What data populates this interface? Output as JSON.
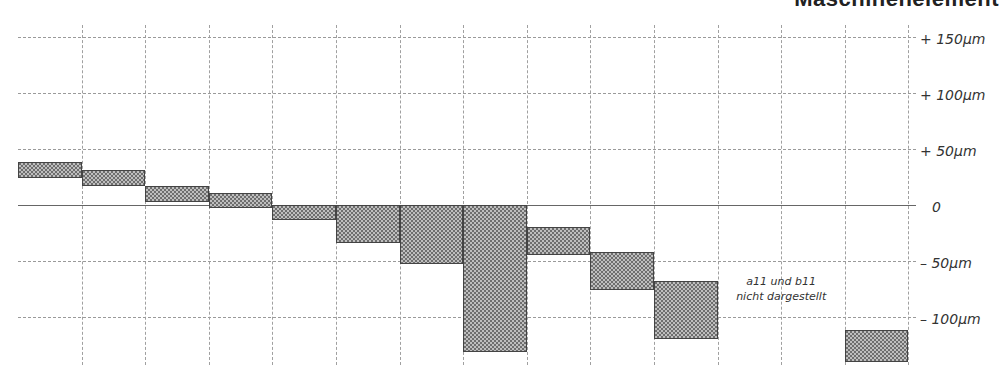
{
  "heading": "Maschinenelement",
  "chart_data": {
    "type": "bar",
    "subtype": "floating-range (tolerance bands)",
    "title": "",
    "xlabel": "",
    "ylabel": "µm",
    "ylim": [
      -150,
      150
    ],
    "y_ticks": [
      {
        "value": 150,
        "label": "+ 150µm"
      },
      {
        "value": 100,
        "label": "+ 100µm"
      },
      {
        "value": 50,
        "label": "+  50µm"
      },
      {
        "value": 0,
        "label": "0"
      },
      {
        "value": -50,
        "label": "–  50µm"
      },
      {
        "value": -100,
        "label": "– 100µm"
      }
    ],
    "grid": true,
    "columns": 14,
    "series": [
      {
        "name": "tolerance band",
        "ranges": [
          {
            "column": 0,
            "upper": 38,
            "lower": 24
          },
          {
            "column": 1,
            "upper": 31,
            "lower": 17
          },
          {
            "column": 2,
            "upper": 17,
            "lower": 3
          },
          {
            "column": 3,
            "upper": 11,
            "lower": -3
          },
          {
            "column": 4,
            "upper": 0,
            "lower": -13
          },
          {
            "column": 5,
            "upper": 0,
            "lower": -34
          },
          {
            "column": 6,
            "upper": 0,
            "lower": -53
          },
          {
            "column": 7,
            "upper": 0,
            "lower": -131
          },
          {
            "column": 8,
            "upper": -20,
            "lower": -45
          },
          {
            "column": 9,
            "upper": -42,
            "lower": -76
          },
          {
            "column": 10,
            "upper": -68,
            "lower": -120
          },
          {
            "column": 13,
            "upper": -112,
            "lower": -140
          }
        ]
      }
    ],
    "annotations": [
      {
        "text": "a11 und b11",
        "column": 11.5,
        "y": -70
      },
      {
        "text": "nicht dargestellt",
        "column": 11.5,
        "y": -84
      }
    ]
  },
  "note": {
    "line1": "a11 und b11",
    "line2": "nicht dargestellt"
  },
  "layout": {
    "x0": 18,
    "col_width": 63.6,
    "zero_y": 205,
    "px_per_um": 1.12,
    "grid_top": 25,
    "grid_bottom": 365,
    "grid_right": 908,
    "bar_color": "#6e6e6e"
  }
}
